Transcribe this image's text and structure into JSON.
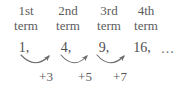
{
  "figure": {
    "text_color": "#58585a",
    "background_color": "#ffffff",
    "arrow_color": "#6b6b6d"
  },
  "headers": [
    {
      "ordinal": "1st",
      "word": "term"
    },
    {
      "ordinal": "2nd",
      "word": "term"
    },
    {
      "ordinal": "3rd",
      "word": "term"
    },
    {
      "ordinal": "4th",
      "word": "term"
    }
  ],
  "sequence": {
    "terms": [
      "1,",
      "4,",
      "9,",
      "16,"
    ],
    "values": [
      1,
      4,
      9,
      16
    ],
    "continuation": "..."
  },
  "differences": {
    "labels": [
      "+3",
      "+5",
      "+7"
    ],
    "values": [
      3,
      5,
      7
    ]
  }
}
